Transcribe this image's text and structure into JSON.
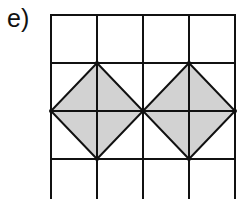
{
  "label": "e)",
  "grid": {
    "columns": 4,
    "rows_visible": 4,
    "x": [
      51,
      97,
      143,
      189,
      235
    ],
    "y": [
      15,
      63,
      111,
      159,
      199
    ]
  },
  "shapes": [
    {
      "type": "diamond",
      "center": [
        97,
        111
      ],
      "vertices": [
        [
          97,
          63
        ],
        [
          143,
          111
        ],
        [
          97,
          159
        ],
        [
          51,
          111
        ]
      ]
    },
    {
      "type": "diamond",
      "center": [
        189,
        111
      ],
      "vertices": [
        [
          189,
          63
        ],
        [
          235,
          111
        ],
        [
          189,
          159
        ],
        [
          143,
          111
        ]
      ]
    }
  ],
  "colors": {
    "line": "#111111",
    "fill": "#d2d2d2",
    "background": "#ffffff"
  }
}
